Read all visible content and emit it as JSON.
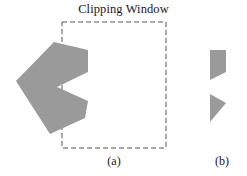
{
  "figure": {
    "title": "Clipping Window",
    "background_color": "#ffffff",
    "width": 247,
    "height": 176
  },
  "clipping_window": {
    "label": "Clipping Window",
    "stroke_color": "#555555",
    "stroke_width": 1,
    "dash_pattern": "5,3",
    "fill": "none",
    "x": 62,
    "y": 22,
    "width": 104,
    "height": 126
  },
  "panels": [
    {
      "id": "a",
      "caption": "(a)",
      "description": "Concave arrow polygon overlapping the left edge of the clipping window",
      "polygon": {
        "name": "source-polygon",
        "fill_color": "#9a9a9a",
        "stroke": "none",
        "points": "54,42 88,50 88,72 57,87 88,101 85,118 50,134 16,81"
      }
    },
    {
      "id": "b",
      "caption": "(b)",
      "description": "Result of clipping the polygon against the clipping window",
      "shapes": [
        {
          "name": "clipped-upper-quad",
          "fill_color": "#9a9a9a",
          "stroke": "none",
          "points": "210,50 226,50 226,72 210,80"
        },
        {
          "name": "clipped-lower-triangle",
          "fill_color": "#9a9a9a",
          "stroke": "none",
          "points": "210,94 226,103 210,122"
        }
      ]
    }
  ],
  "colors": {
    "polygon_fill": "#9a9a9a",
    "dash_stroke": "#555555",
    "text": "#1a1a1a",
    "background": "#ffffff"
  }
}
